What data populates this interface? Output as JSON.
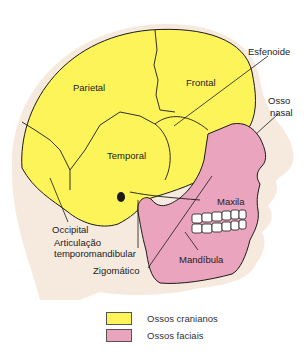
{
  "labels": {
    "parietal": "Parietal",
    "frontal": "Frontal",
    "esfenoide": "Esfenoide",
    "osso_nasal_1": "Osso",
    "osso_nasal_2": "nasal",
    "temporal": "Temporal",
    "maxila": "Maxila",
    "occipital": "Occipital",
    "atm_1": "Articulação",
    "atm_2": "temporomandibular",
    "mandibula": "Mandíbula",
    "zigomatico": "Zigomático"
  },
  "legend": [
    {
      "label": "Ossos cranianos",
      "color": "#fdf45a"
    },
    {
      "label": "Ossos faciais",
      "color": "#eba4bd"
    }
  ],
  "colors": {
    "cranial": "#fdf45a",
    "facial": "#eba4bd",
    "skin": "#f6e9dd",
    "line": "#1a1a1a"
  }
}
